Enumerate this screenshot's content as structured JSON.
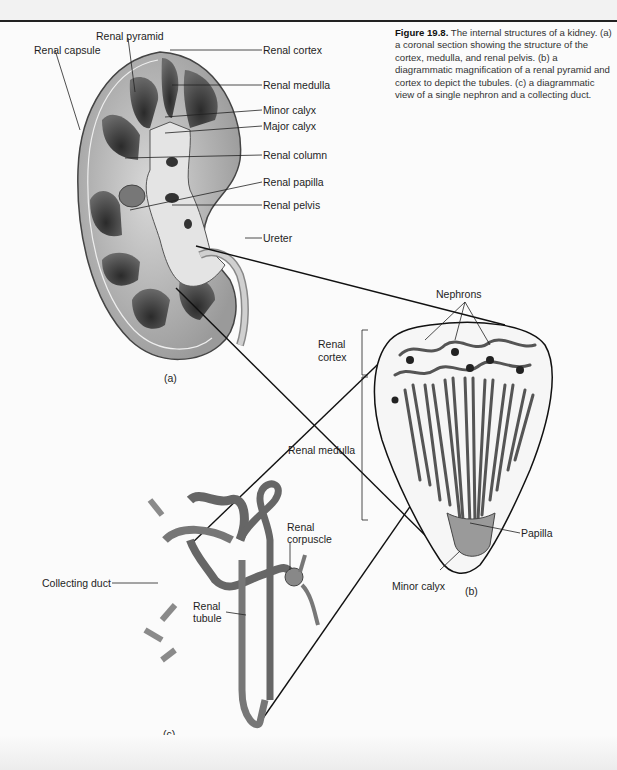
{
  "figure": {
    "number": "Figure 19.8.",
    "caption": "The internal structures of a kidney. (a) a coronal section showing the structure of the cortex, medulla, and renal pelvis. (b) a diagrammatic magnification of a renal pyramid and cortex to depict the tubules. (c) a diagrammatic view of a single nephron and a collecting duct."
  },
  "panel_a": {
    "label": "(a)",
    "labels": {
      "renal_pyramid": "Renal pyramid",
      "renal_capsule": "Renal capsule",
      "renal_cortex": "Renal cortex",
      "renal_medulla": "Renal medulla",
      "minor_calyx": "Minor calyx",
      "major_calyx": "Major calyx",
      "renal_column": "Renal column",
      "renal_papilla": "Renal papilla",
      "renal_pelvis": "Renal pelvis",
      "ureter": "Ureter"
    }
  },
  "panel_b": {
    "label": "(b)",
    "labels": {
      "nephrons": "Nephrons",
      "renal_cortex_line1": "Renal",
      "renal_cortex_line2": "cortex",
      "renal_medulla": "Renal medulla",
      "papilla": "Papilla",
      "minor_calyx": "Minor calyx"
    }
  },
  "panel_c": {
    "label": "(c)",
    "labels": {
      "collecting_duct": "Collecting duct",
      "renal_tubule_line1": "Renal",
      "renal_tubule_line2": "tubule",
      "renal_corpuscle_line1": "Renal",
      "renal_corpuscle_line2": "corpuscle"
    }
  }
}
